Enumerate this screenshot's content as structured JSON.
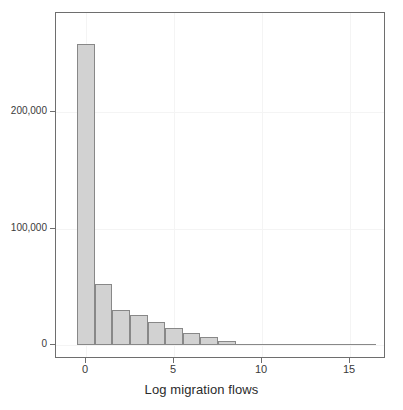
{
  "chart_data": {
    "type": "bar",
    "subtype": "histogram",
    "title": "",
    "xlabel": "Log migration flows",
    "ylabel": "",
    "xlim": [
      -1.2,
      17.5
    ],
    "ylim": [
      0,
      285000
    ],
    "grid": true,
    "legend": null,
    "xticks": [
      0,
      5,
      10,
      15
    ],
    "xtick_labels": [
      "0",
      "5",
      "10",
      "15"
    ],
    "yticks": [
      0,
      100000,
      200000
    ],
    "ytick_labels": [
      "0",
      "100,000",
      "200,000"
    ],
    "bin_width": 1,
    "bin_starts": [
      -0.5,
      0.5,
      1.5,
      2.5,
      3.5,
      4.5,
      5.5,
      6.5,
      7.5,
      8.5,
      9.5,
      10.5,
      11.5,
      12.5,
      13.5,
      14.5,
      15.5
    ],
    "categories": [
      "-0.5–0.5",
      "0.5–1.5",
      "1.5–2.5",
      "2.5–3.5",
      "3.5–4.5",
      "4.5–5.5",
      "5.5–6.5",
      "6.5–7.5",
      "7.5–8.5",
      "8.5–9.5",
      "9.5–10.5",
      "10.5–11.5",
      "11.5–12.5",
      "12.5–13.5",
      "13.5–14.5",
      "14.5–15.5",
      "15.5–16.5"
    ],
    "values": [
      258000,
      52000,
      30000,
      26000,
      20000,
      15000,
      10500,
      6500,
      3200,
      1500,
      600,
      200,
      60,
      20,
      0,
      0,
      0
    ],
    "bar_fill_color": "#d2d2d2",
    "bar_edge_color": "#888888",
    "panel_border_color": "#6e6e6e",
    "grid_color": "#f4f4f4",
    "text_color": "#3a3a3a"
  },
  "axis": {
    "x_title": "Log migration flows"
  }
}
